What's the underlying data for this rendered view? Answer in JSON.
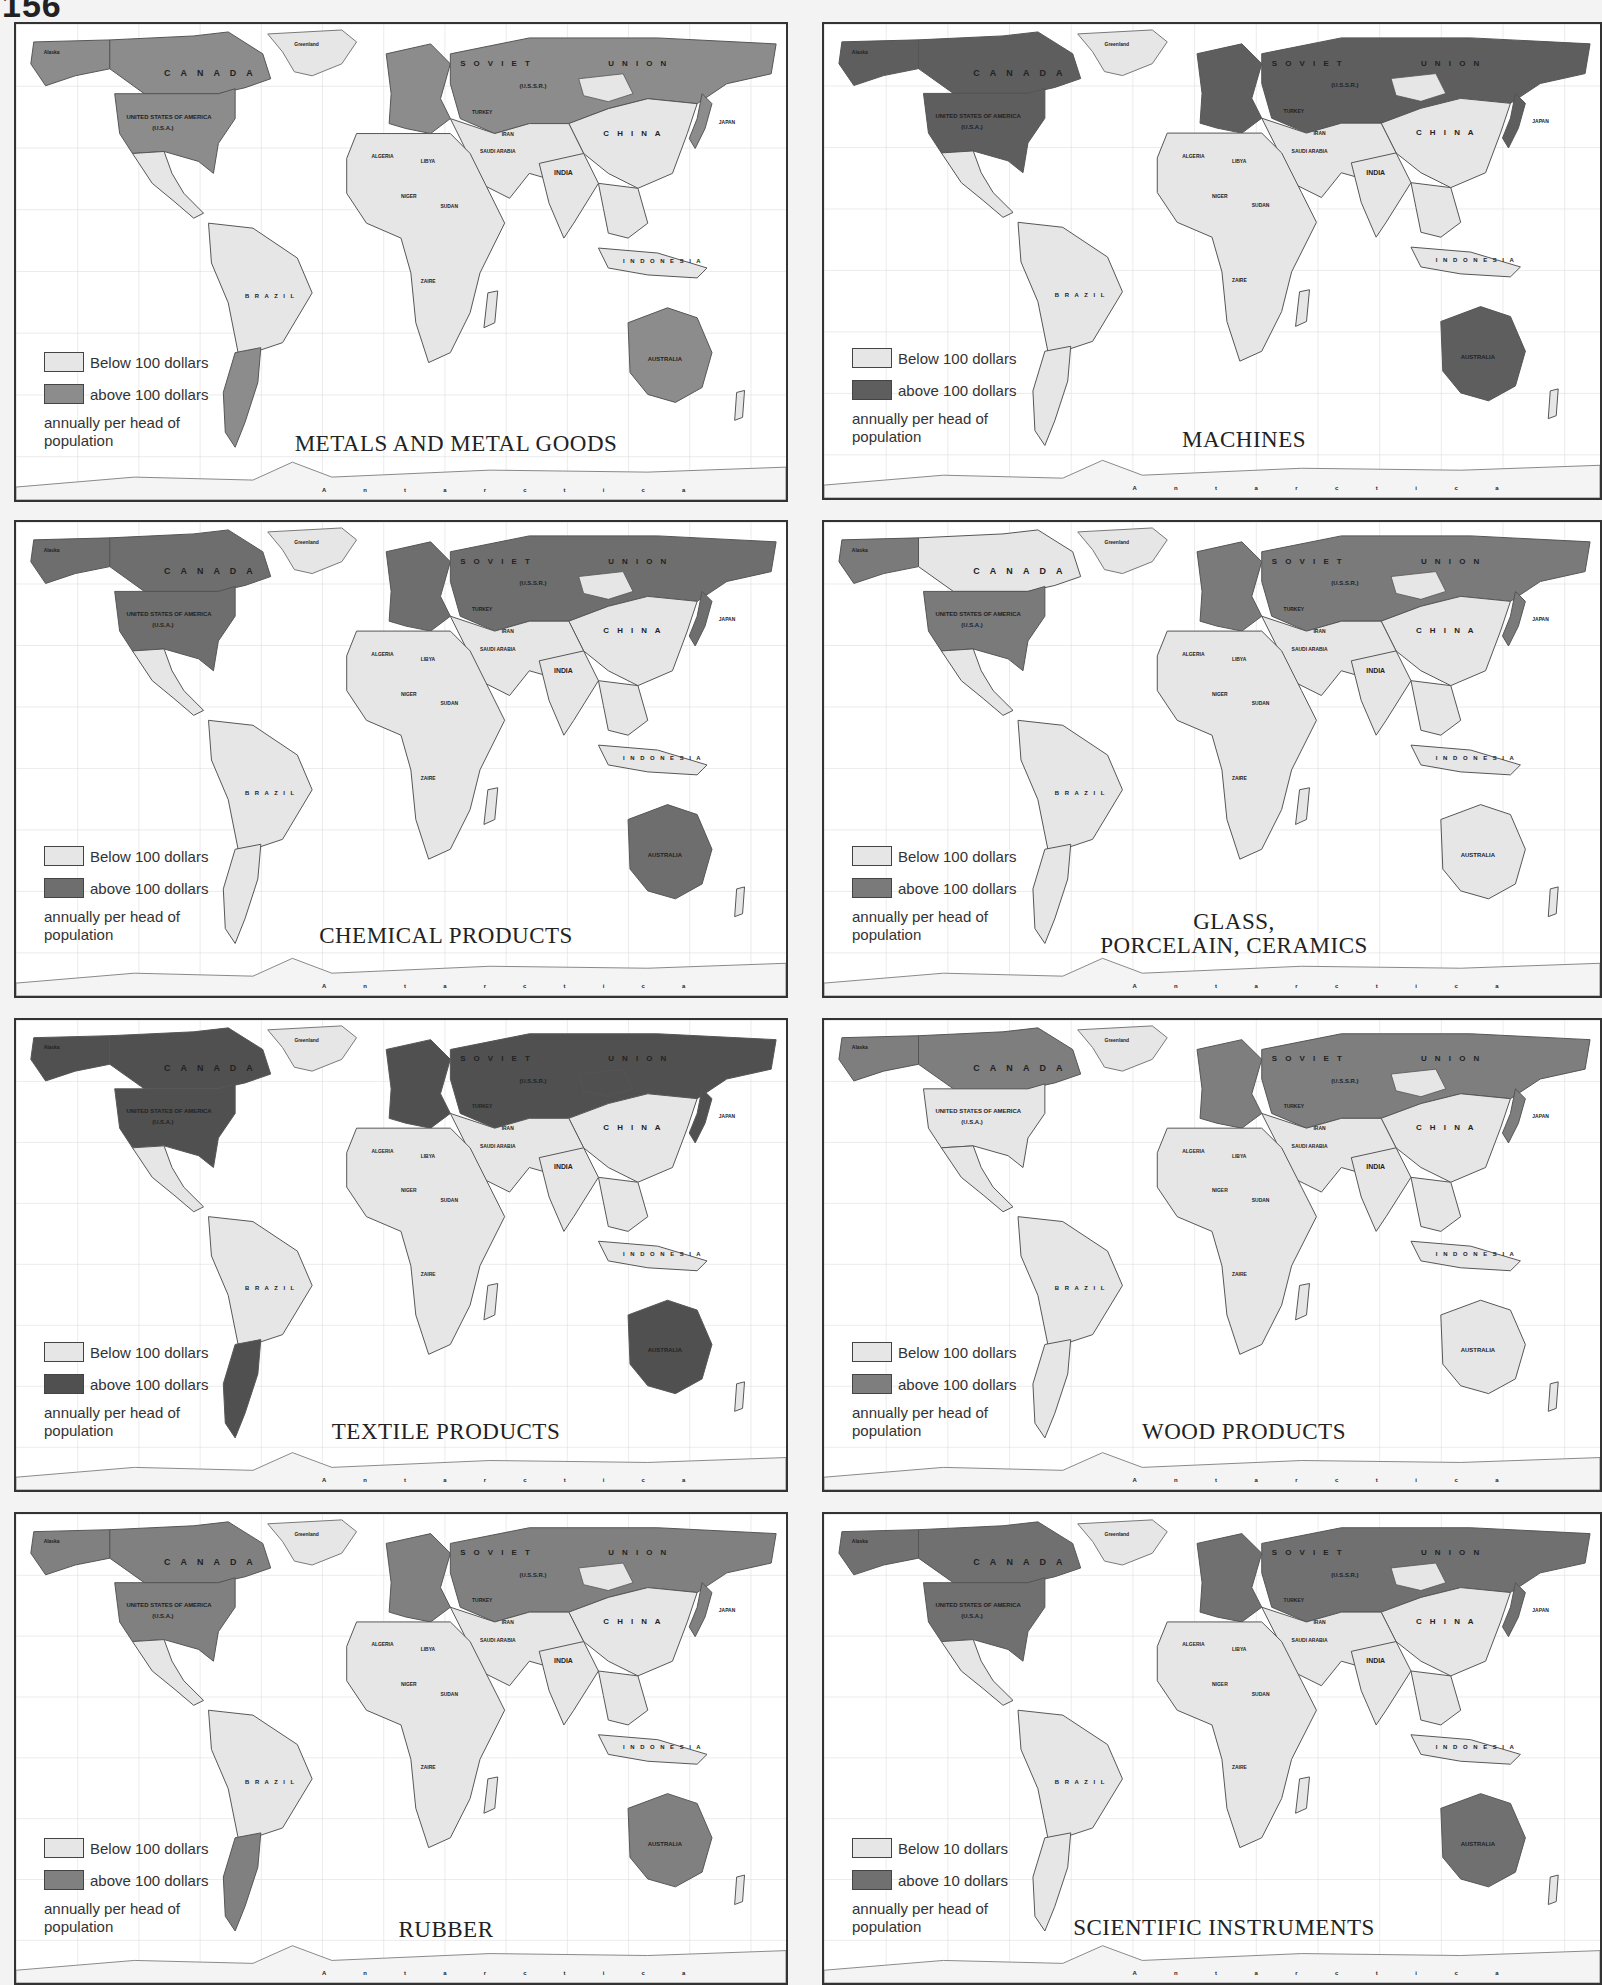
{
  "page": {
    "number": "156"
  },
  "colors": {
    "below_fill": "#e6e6e6",
    "above_fill": "#8c8c8c",
    "above_fill_dark": "#5e5e5e",
    "ocean": "#ffffff",
    "border": "#333333",
    "grid": "#d4d4d4"
  },
  "map_labels": {
    "canada": "C A N A D A",
    "usa": "UNITED STATES OF AMERICA",
    "usa_abbr": "(U.S.A.)",
    "soviet": "S O V I E T",
    "union": "U N I O N",
    "ussr": "(U.S.S.R.)",
    "china": "C H I N A",
    "india": "INDIA",
    "brazil": "B R A Z I L",
    "australia": "AUSTRALIA",
    "japan": "JAPAN",
    "indonesia": "I N D O N E S I A",
    "greenland": "Greenland",
    "alaska": "Alaska",
    "mexico": "MEXICO",
    "cuba": "CUBA",
    "turkey": "TURKEY",
    "iran": "IRAN",
    "algeria": "ALGERIA",
    "libya": "LIBYA",
    "egypt": "EGYPT",
    "niger": "NIGER",
    "chad": "CHAD",
    "sudan": "SUDAN",
    "saudi_arabia": "SAUDI ARABIA",
    "zaire": "ZAIRE",
    "angola": "ANGOLA",
    "south_africa": "SOUTH AFRICA",
    "madagascar": "MADAGASCAR",
    "new_zealand": "NEW ZEALAND",
    "antarctica": "A n t a r c t i c a",
    "mongolia": "PEOPLES REPUBLIC OF MONGOLIA"
  },
  "panels": [
    {
      "id": "metals",
      "title": "METALS AND METAL GOODS",
      "legend": {
        "below": "Below 100 dollars",
        "above": "above 100 dollars",
        "note": "annually per head of population"
      },
      "above_regions": [
        "Canada",
        "USA",
        "Alaska",
        "Europe",
        "USSR",
        "Japan",
        "Australia",
        "Argentina"
      ],
      "above_shade": "#8c8c8c"
    },
    {
      "id": "machines",
      "title": "MACHINES",
      "legend": {
        "below": "Below 100 dollars",
        "above": "above 100 dollars",
        "note": "annually per head of population"
      },
      "above_regions": [
        "Canada",
        "USA",
        "Alaska",
        "Europe",
        "USSR",
        "Japan",
        "Australia"
      ],
      "above_shade": "#5e5e5e"
    },
    {
      "id": "chemicals",
      "title": "CHEMICAL PRODUCTS",
      "legend": {
        "below": "Below 100 dollars",
        "above": "above 100 dollars",
        "note": "annually per head of population"
      },
      "above_regions": [
        "Canada",
        "USA",
        "Alaska",
        "Europe",
        "USSR",
        "Japan",
        "Australia"
      ],
      "above_shade": "#6e6e6e"
    },
    {
      "id": "glass",
      "title": "GLASS,\nPORCELAIN, CERAMICS",
      "title_line1": "GLASS,",
      "title_line2": "PORCELAIN, CERAMICS",
      "legend": {
        "below": "Below 100 dollars",
        "above": "above 100 dollars",
        "note": "annually per head of population"
      },
      "above_regions": [
        "USA",
        "Alaska",
        "Europe",
        "USSR",
        "Japan"
      ],
      "above_shade": "#7a7a7a"
    },
    {
      "id": "textiles",
      "title": "TEXTILE PRODUCTS",
      "legend": {
        "below": "Below 100 dollars",
        "above": "above 100 dollars",
        "note": "annually per head of population"
      },
      "above_regions": [
        "Canada",
        "USA",
        "Alaska",
        "Europe",
        "USSR",
        "Mongolia",
        "Japan",
        "Australia",
        "Argentina"
      ],
      "above_shade": "#505050"
    },
    {
      "id": "wood",
      "title": "WOOD PRODUCTS",
      "legend": {
        "below": "Below 100 dollars",
        "above": "above 100 dollars",
        "note": "annually per head of population"
      },
      "above_regions": [
        "Canada",
        "Alaska",
        "Europe",
        "USSR",
        "Japan"
      ],
      "above_shade": "#7e7e7e"
    },
    {
      "id": "rubber",
      "title": "RUBBER",
      "legend": {
        "below": "Below 100 dollars",
        "above": "above 100 dollars",
        "note": "annually per head of population"
      },
      "above_regions": [
        "Canada",
        "USA",
        "Alaska",
        "Europe",
        "USSR",
        "Japan",
        "Australia",
        "Argentina"
      ],
      "above_shade": "#808080"
    },
    {
      "id": "scientific",
      "title": "SCIENTIFIC INSTRUMENTS",
      "legend": {
        "below": "Below 10 dollars",
        "above": "above 10 dollars",
        "note": "annually per head of population"
      },
      "above_regions": [
        "Canada",
        "USA",
        "Alaska",
        "Europe",
        "USSR",
        "Japan",
        "Australia"
      ],
      "above_shade": "#707070"
    }
  ]
}
